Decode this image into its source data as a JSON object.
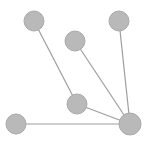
{
  "diagram": {
    "type": "graph",
    "colors": {
      "node_fill": "#b9b9b9",
      "node_stroke": "#aaaaaa",
      "edge": "#9e9e9e",
      "background": "#ffffff"
    },
    "nodes": [
      {
        "id": "n1",
        "cx": 34,
        "cy": 21,
        "r": 10
      },
      {
        "id": "n2",
        "cx": 119,
        "cy": 21,
        "r": 10
      },
      {
        "id": "n3",
        "cx": 75,
        "cy": 41,
        "r": 10
      },
      {
        "id": "n4",
        "cx": 77,
        "cy": 104,
        "r": 10
      },
      {
        "id": "n5",
        "cx": 16,
        "cy": 124,
        "r": 10
      },
      {
        "id": "n6",
        "cx": 130,
        "cy": 124,
        "r": 11
      }
    ],
    "edges": [
      {
        "from": "n1",
        "to": "n4"
      },
      {
        "from": "n4",
        "to": "n6"
      },
      {
        "from": "n3",
        "to": "n6"
      },
      {
        "from": "n2",
        "to": "n6"
      },
      {
        "from": "n5",
        "to": "n6"
      }
    ]
  }
}
